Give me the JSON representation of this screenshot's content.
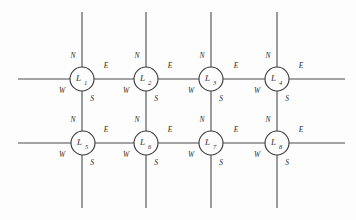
{
  "figure": {
    "title": "",
    "background_color": "#fdfdfd",
    "line_color": "#4a4a4a",
    "node_stroke_color": "#3d3d3d",
    "text_color": "#2b2b2b"
  },
  "ports": {
    "north": "N",
    "east": "E",
    "west": "W",
    "south": "S"
  },
  "nodes": [
    {
      "id": "L1",
      "base": "L",
      "sub": "1",
      "cx": 82,
      "cy": 79,
      "r": 12,
      "row": 0,
      "col": 0
    },
    {
      "id": "L2",
      "base": "L",
      "sub": "2",
      "cx": 146,
      "cy": 79,
      "r": 12,
      "row": 0,
      "col": 1
    },
    {
      "id": "L3",
      "base": "L",
      "sub": "3",
      "cx": 211,
      "cy": 79,
      "r": 12,
      "row": 0,
      "col": 2
    },
    {
      "id": "L4",
      "base": "L",
      "sub": "4",
      "cx": 277,
      "cy": 79,
      "r": 12,
      "row": 0,
      "col": 3
    },
    {
      "id": "L5",
      "base": "L",
      "sub": "5",
      "cx": 83,
      "cy": 143,
      "r": 12,
      "row": 1,
      "col": 0
    },
    {
      "id": "L6",
      "base": "L",
      "sub": "6",
      "cx": 146,
      "cy": 143,
      "r": 12,
      "row": 1,
      "col": 1
    },
    {
      "id": "L7",
      "base": "L",
      "sub": "7",
      "cx": 211,
      "cy": 143,
      "r": 12,
      "row": 1,
      "col": 2
    },
    {
      "id": "L8",
      "base": "L",
      "sub": "8",
      "cx": 277,
      "cy": 143,
      "r": 12,
      "row": 1,
      "col": 3
    }
  ],
  "lines": {
    "horizontal": [
      {
        "name": "row-1-wire",
        "x1": 18,
        "y1": 79,
        "x2": 345,
        "y2": 79
      },
      {
        "name": "row-2-wire",
        "x1": 18,
        "y1": 143,
        "x2": 345,
        "y2": 143
      }
    ],
    "vertical": [
      {
        "name": "col-1-wire",
        "x1": 82,
        "y1": 12,
        "x2": 82,
        "y2": 208
      },
      {
        "name": "col-2-wire",
        "x1": 146,
        "y1": 12,
        "x2": 146,
        "y2": 208
      },
      {
        "name": "col-3-wire",
        "x1": 211,
        "y1": 12,
        "x2": 211,
        "y2": 208
      },
      {
        "name": "col-4-wire",
        "x1": 277,
        "y1": 12,
        "x2": 277,
        "y2": 208
      }
    ]
  },
  "port_labels": [
    {
      "node": "L1",
      "port": "N",
      "text": "N",
      "x": 73,
      "y": 58
    },
    {
      "node": "L1",
      "port": "E",
      "text": "E",
      "x": 106,
      "y": 68
    },
    {
      "node": "L1",
      "port": "W",
      "text": "W",
      "x": 62,
      "y": 93
    },
    {
      "node": "L1",
      "port": "S",
      "text": "S",
      "x": 92,
      "y": 101
    },
    {
      "node": "L2",
      "port": "N",
      "text": "N",
      "x": 137,
      "y": 58
    },
    {
      "node": "L2",
      "port": "E",
      "text": "E",
      "x": 170,
      "y": 68
    },
    {
      "node": "L2",
      "port": "W",
      "text": "W",
      "x": 126,
      "y": 93
    },
    {
      "node": "L2",
      "port": "S",
      "text": "S",
      "x": 156,
      "y": 101
    },
    {
      "node": "L3",
      "port": "N",
      "text": "N",
      "x": 202,
      "y": 58
    },
    {
      "node": "L3",
      "port": "E",
      "text": "E",
      "x": 236,
      "y": 68
    },
    {
      "node": "L3",
      "port": "W",
      "text": "W",
      "x": 191,
      "y": 93
    },
    {
      "node": "L3",
      "port": "S",
      "text": "S",
      "x": 221,
      "y": 101
    },
    {
      "node": "L4",
      "port": "N",
      "text": "N",
      "x": 268,
      "y": 58
    },
    {
      "node": "L4",
      "port": "E",
      "text": "E",
      "x": 301,
      "y": 68
    },
    {
      "node": "L4",
      "port": "W",
      "text": "W",
      "x": 257,
      "y": 93
    },
    {
      "node": "L4",
      "port": "S",
      "text": "S",
      "x": 287,
      "y": 101
    },
    {
      "node": "L5",
      "port": "N",
      "text": "N",
      "x": 73,
      "y": 122
    },
    {
      "node": "L5",
      "port": "E",
      "text": "E",
      "x": 106,
      "y": 132
    },
    {
      "node": "L5",
      "port": "W",
      "text": "W",
      "x": 62,
      "y": 157
    },
    {
      "node": "L5",
      "port": "S",
      "text": "S",
      "x": 92,
      "y": 165
    },
    {
      "node": "L6",
      "port": "N",
      "text": "N",
      "x": 137,
      "y": 122
    },
    {
      "node": "L6",
      "port": "E",
      "text": "E",
      "x": 170,
      "y": 132
    },
    {
      "node": "L6",
      "port": "W",
      "text": "W",
      "x": 126,
      "y": 157
    },
    {
      "node": "L6",
      "port": "S",
      "text": "S",
      "x": 156,
      "y": 165
    },
    {
      "node": "L7",
      "port": "N",
      "text": "N",
      "x": 202,
      "y": 122
    },
    {
      "node": "L7",
      "port": "E",
      "text": "E",
      "x": 236,
      "y": 132
    },
    {
      "node": "L7",
      "port": "W",
      "text": "W",
      "x": 191,
      "y": 157
    },
    {
      "node": "L7",
      "port": "S",
      "text": "S",
      "x": 221,
      "y": 165
    },
    {
      "node": "L8",
      "port": "N",
      "text": "N",
      "x": 268,
      "y": 122
    },
    {
      "node": "L8",
      "port": "E",
      "text": "E",
      "x": 301,
      "y": 132
    },
    {
      "node": "L8",
      "port": "W",
      "text": "W",
      "x": 257,
      "y": 157
    },
    {
      "node": "L8",
      "port": "S",
      "text": "S",
      "x": 287,
      "y": 165
    }
  ]
}
